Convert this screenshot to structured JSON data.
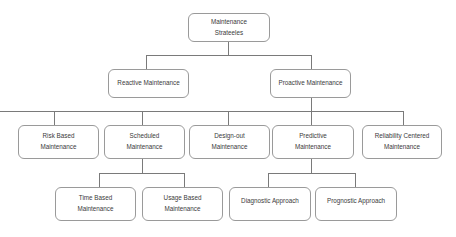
{
  "diagram": {
    "type": "hierarchy-tree",
    "root": {
      "label": "Maintenance Strateeles"
    },
    "level1": [
      {
        "label": "Reactive Maintenance"
      },
      {
        "label": "Proactive Maintenance"
      }
    ],
    "level2": [
      {
        "label": "Risk Based Maintenance"
      },
      {
        "label": "Scheduled Maintenance"
      },
      {
        "label": "Design-out Maintenance"
      },
      {
        "label": "Predictive Maintenance"
      },
      {
        "label": "Reliability Centered Maintenance"
      }
    ],
    "level3_scheduled": [
      {
        "label": "Time Based Maintenance"
      },
      {
        "label": "Usage Based Maintenance"
      }
    ],
    "level3_predictive": [
      {
        "label": "Diagnostic Approach"
      },
      {
        "label": "Prognostic Approach"
      }
    ]
  }
}
